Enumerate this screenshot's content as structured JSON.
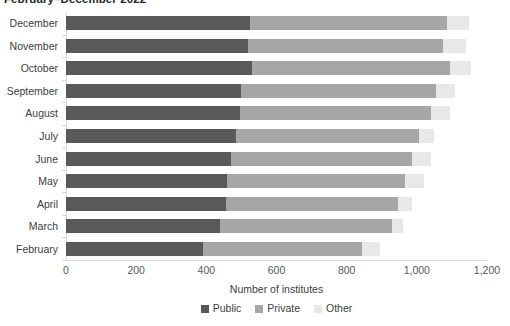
{
  "chart_data": {
    "type": "bar",
    "orientation": "horizontal",
    "stacked": true,
    "title": "February–December 2022",
    "xlabel": "Number of institutes",
    "ylabel": "",
    "xlim": [
      0,
      1200
    ],
    "xticks": [
      0,
      200,
      400,
      600,
      800,
      1000,
      1200
    ],
    "xticklabels": [
      "0",
      "200",
      "400",
      "600",
      "800",
      "1,000",
      "1,200"
    ],
    "grid": false,
    "legend_position": "bottom",
    "categories": [
      "December",
      "November",
      "October",
      "September",
      "August",
      "July",
      "June",
      "May",
      "April",
      "March",
      "February"
    ],
    "series": [
      {
        "name": "Public",
        "color": "#595959",
        "values": [
          525,
          520,
          530,
          500,
          495,
          485,
          470,
          460,
          455,
          440,
          390
        ]
      },
      {
        "name": "Private",
        "color": "#a6a6a6",
        "values": [
          560,
          555,
          565,
          555,
          545,
          520,
          515,
          505,
          490,
          490,
          455
        ]
      },
      {
        "name": "Other",
        "color": "#e8e8e8",
        "values": [
          65,
          65,
          60,
          55,
          55,
          45,
          55,
          55,
          40,
          30,
          50
        ]
      }
    ],
    "totals": [
      1150,
      1140,
      1155,
      1110,
      1095,
      1050,
      1040,
      1020,
      985,
      960,
      895
    ]
  },
  "legend": {
    "items": [
      {
        "label": "Public",
        "color": "#595959"
      },
      {
        "label": "Private",
        "color": "#a6a6a6"
      },
      {
        "label": "Other",
        "color": "#e8e8e8"
      }
    ]
  }
}
